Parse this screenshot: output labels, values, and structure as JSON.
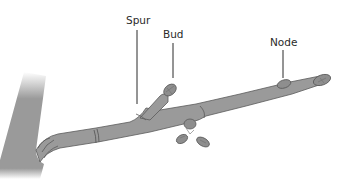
{
  "diagram": {
    "labels": {
      "spur": "Spur",
      "bud": "Bud",
      "node": "Node"
    },
    "colors": {
      "bark": "#9a9a9a",
      "bark_dark": "#6f6f6f",
      "outline": "#5a5a5a",
      "leader_line": "#2a2a2a",
      "background": "#ffffff"
    }
  }
}
